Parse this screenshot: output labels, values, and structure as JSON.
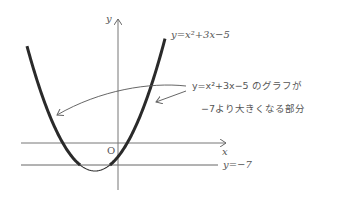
{
  "diagram": {
    "axes": {
      "x_label": "x",
      "y_label": "y",
      "origin_label": "O"
    },
    "curve": {
      "equation_label": "y=x²+3x−5",
      "vertex_px": [
        95,
        171
      ],
      "a_px": 0.027
    },
    "line": {
      "label": "y=−7",
      "y_px": 165
    },
    "annotation": {
      "line1": "y=x²+3x−5 のグラフが",
      "line2": "−7より大きくなる部分"
    },
    "colors": {
      "curve": "#2a2a2a",
      "axes": "#777777",
      "text": "#555555"
    }
  }
}
